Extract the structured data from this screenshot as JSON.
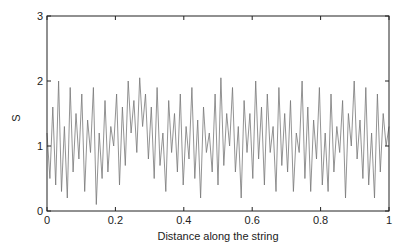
{
  "chart_data": {
    "type": "line",
    "title": "",
    "xlabel": "Distance along the string",
    "ylabel": "S",
    "xlim": [
      0,
      1
    ],
    "ylim": [
      0,
      3
    ],
    "x_ticks": [
      "0",
      "0.2",
      "0.4",
      "0.6",
      "0.8",
      "1"
    ],
    "y_ticks": [
      "0",
      "1",
      "2",
      "3"
    ],
    "grid": false,
    "legend": null,
    "series": [
      {
        "name": "S",
        "color": "#777777",
        "x_start": 0,
        "x_end": 1,
        "values": [
          1.2,
          0.5,
          1.6,
          0.4,
          2.0,
          0.3,
          1.3,
          0.2,
          1.9,
          0.6,
          1.5,
          0.8,
          1.8,
          0.3,
          1.4,
          0.9,
          1.9,
          0.1,
          1.2,
          0.5,
          1.7,
          0.6,
          1.3,
          1.0,
          1.8,
          0.4,
          1.6,
          0.7,
          2.0,
          1.2,
          1.7,
          0.9,
          2.05,
          1.3,
          1.8,
          0.8,
          1.6,
          0.5,
          1.9,
          0.7,
          1.2,
          0.3,
          1.7,
          0.9,
          1.5,
          0.6,
          1.8,
          0.4,
          1.3,
          0.8,
          1.9,
          0.5,
          1.4,
          0.2,
          1.6,
          0.9,
          1.2,
          0.6,
          1.8,
          0.4,
          2.05,
          0.7,
          1.5,
          1.0,
          1.9,
          0.6,
          1.3,
          0.2,
          1.7,
          0.9,
          1.5,
          0.5,
          2.0,
          0.8,
          1.6,
          0.4,
          1.8,
          0.9,
          1.3,
          0.3,
          1.9,
          0.7,
          1.5,
          0.6,
          1.7,
          0.3,
          1.2,
          0.9,
          2.0,
          0.5,
          1.6,
          0.3,
          1.4,
          0.8,
          1.9,
          0.4,
          1.2,
          0.3,
          1.8,
          0.6,
          1.3,
          0.9,
          1.7,
          0.2,
          1.5,
          1.0,
          2.0,
          0.8,
          1.4,
          0.5,
          1.9,
          0.4,
          1.2,
          0.2,
          1.8,
          0.6,
          1.5,
          1.0,
          1.3
        ]
      }
    ]
  }
}
